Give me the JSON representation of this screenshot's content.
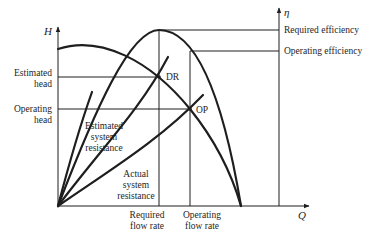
{
  "diagram": {
    "axes": {
      "y_left_label": "H",
      "y_right_label": "η",
      "x_label": "Q"
    },
    "left_labels": {
      "estimated_head": [
        "Estimated",
        "head"
      ],
      "operating_head": [
        "Operating",
        "head"
      ]
    },
    "right_labels": {
      "required_efficiency": "Required efficiency",
      "operating_efficiency": "Operating efficiency"
    },
    "bottom_labels": {
      "required_flow_rate": [
        "Required",
        "flow rate"
      ],
      "operating_flow_rate": [
        "Operating",
        "flow rate"
      ]
    },
    "points": {
      "design": "DR",
      "operating": "OP"
    },
    "curve_labels": {
      "estimated_system_resistance": [
        "Estimated",
        "system",
        "resistance"
      ],
      "actual_system_resistance": [
        "Actual",
        "system",
        "resistance"
      ]
    },
    "colors": {
      "line": "#1e1e1e",
      "background": "#ffffff"
    }
  }
}
